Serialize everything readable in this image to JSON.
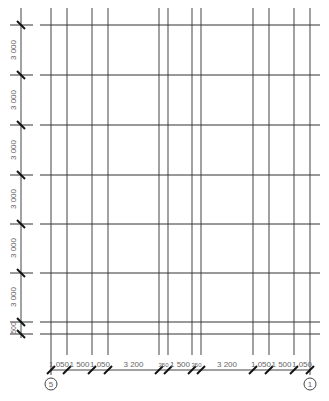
{
  "drawing": {
    "type": "structural-grid-plan",
    "colors": {
      "background": "#ffffff",
      "grid_line": "#333333",
      "vertical_grid_line": "#555555",
      "dimension_line": "#444444",
      "tick": "#111111",
      "text": "#666666"
    },
    "vertical_grid_x": [
      51,
      67,
      92,
      108,
      159,
      168,
      192,
      201,
      253,
      269,
      294,
      310
    ],
    "horizontal_grid_y": [
      25,
      75,
      125,
      175,
      224,
      273,
      322,
      334
    ],
    "vertical_dimensions": [
      {
        "label": "3 000",
        "y_mid": 50
      },
      {
        "label": "3 000",
        "y_mid": 100
      },
      {
        "label": "3 000",
        "y_mid": 150
      },
      {
        "label": "3 000",
        "y_mid": 199
      },
      {
        "label": "3 000",
        "y_mid": 248
      },
      {
        "label": "3 000",
        "y_mid": 297
      },
      {
        "label": "500",
        "y_mid": 328
      }
    ],
    "horizontal_dimensions": [
      {
        "label": "1 050",
        "x1": 51,
        "x2": 67
      },
      {
        "label": "1 500",
        "x1": 67,
        "x2": 92
      },
      {
        "label": "1 050",
        "x1": 92,
        "x2": 108
      },
      {
        "label": "3 200",
        "x1": 108,
        "x2": 159
      },
      {
        "label": "350",
        "x1": 159,
        "x2": 168
      },
      {
        "label": "1 500",
        "x1": 168,
        "x2": 192
      },
      {
        "label": "350",
        "x1": 192,
        "x2": 201
      },
      {
        "label": "3 200",
        "x1": 201,
        "x2": 253
      },
      {
        "label": "1 050",
        "x1": 253,
        "x2": 269
      },
      {
        "label": "1 500",
        "x1": 269,
        "x2": 294
      },
      {
        "label": "1 050",
        "x1": 294,
        "x2": 310
      }
    ],
    "axis_bubbles": [
      {
        "label": "5",
        "x": 51
      },
      {
        "label": "1",
        "x": 310
      }
    ]
  }
}
